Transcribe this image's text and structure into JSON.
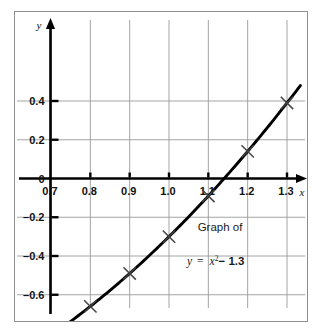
{
  "figure": {
    "background": "#ffffff",
    "frame_color": "#8e8e8e",
    "grid_color": "#9a9a9a",
    "axis_color": "#000000",
    "curve_color": "#000000",
    "marker_color": "#444444"
  },
  "annotations": {
    "caption": "Graph of",
    "equation_lhs": "y",
    "equation_eq": "=",
    "equation_base": "x",
    "equation_exponent": "2",
    "equation_tail": "− 1.3"
  },
  "chart_data": {
    "type": "line",
    "xlabel": "x",
    "ylabel": "y",
    "xlim": [
      0.65,
      1.355
    ],
    "ylim": [
      -0.92,
      0.52
    ],
    "grid": true,
    "legend": "none",
    "x_ticks": [
      0.7,
      0.8,
      0.9,
      1.0,
      1.1,
      1.2,
      1.3
    ],
    "x_tick_labels": [
      "0.7",
      "0.8",
      "0.9",
      "1.0",
      "1.1",
      "1.2",
      "1.3"
    ],
    "y_ticks": [
      0.4,
      0.2,
      0,
      -0.2,
      -0.4,
      -0.6,
      -0.8
    ],
    "y_tick_labels": [
      "0.4",
      "0.2",
      "0",
      "–0.2",
      "–0.4",
      "–0.6",
      "–0.8"
    ],
    "x": [
      0.7,
      0.8,
      0.9,
      1.0,
      1.1,
      1.2,
      1.3
    ],
    "values": [
      -0.81,
      -0.66,
      -0.49,
      -0.3,
      -0.09,
      0.14,
      0.39
    ],
    "marker": "x",
    "series": [
      {
        "name": "y = x² − 1.3",
        "points": [
          {
            "x": 0.7,
            "y": -0.81
          },
          {
            "x": 0.8,
            "y": -0.66
          },
          {
            "x": 0.9,
            "y": -0.49
          },
          {
            "x": 1.0,
            "y": -0.3
          },
          {
            "x": 1.1,
            "y": -0.09
          },
          {
            "x": 1.2,
            "y": 0.14
          },
          {
            "x": 1.3,
            "y": 0.39
          }
        ]
      }
    ]
  }
}
